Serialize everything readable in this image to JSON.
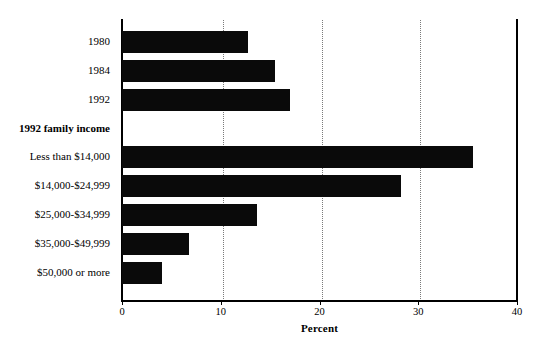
{
  "chart_data": {
    "type": "bar",
    "orientation": "horizontal",
    "title": "",
    "subtitle": "",
    "xlabel": "Percent",
    "ylabel": "",
    "xlim": [
      0,
      40
    ],
    "xticks": [
      0,
      10,
      20,
      30,
      40
    ],
    "xticklabels": [
      "0",
      "10",
      "20",
      "30",
      "40"
    ],
    "grid": "vertical-dotted-at-10-20-30",
    "legend": "none",
    "bar_color": "#0a0a0a",
    "categories": [
      "1980",
      "1984",
      "1992",
      "Less than $14,000",
      "$14,000-$24,999",
      "$25,000-$34,999",
      "$35,000-$49,999",
      "$50,000 or more"
    ],
    "values": [
      12.8,
      15.5,
      17.0,
      35.5,
      28.3,
      13.7,
      6.8,
      4.0
    ],
    "group_headers": [
      {
        "label": "1992 family income",
        "before_category": "Less than $14,000"
      }
    ],
    "annotations": []
  },
  "axis": {
    "x_title": "Percent",
    "ticks": [
      {
        "label": "0",
        "value": 0
      },
      {
        "label": "10",
        "value": 10
      },
      {
        "label": "20",
        "value": 20
      },
      {
        "label": "30",
        "value": 30
      },
      {
        "label": "40",
        "value": 40
      }
    ]
  },
  "rows": [
    {
      "label": "1980",
      "value": 12.8,
      "is_header": false
    },
    {
      "label": "1984",
      "value": 15.5,
      "is_header": false
    },
    {
      "label": "1992",
      "value": 17.0,
      "is_header": false
    },
    {
      "label": "1992 family income",
      "value": null,
      "is_header": true
    },
    {
      "label": "Less than $14,000",
      "value": 35.5,
      "is_header": false
    },
    {
      "label": "$14,000-$24,999",
      "value": 28.3,
      "is_header": false
    },
    {
      "label": "$25,000-$34,999",
      "value": 13.7,
      "is_header": false
    },
    {
      "label": "$35,000-$49,999",
      "value": 6.8,
      "is_header": false
    },
    {
      "label": "$50,000 or more",
      "value": 4.0,
      "is_header": false
    }
  ]
}
